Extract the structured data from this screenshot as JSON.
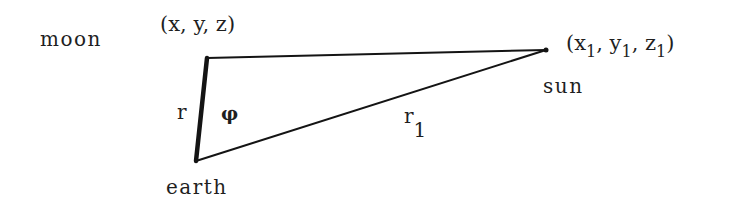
{
  "diagram": {
    "type": "triangle",
    "nodes": {
      "moon": {
        "name": "moon",
        "coords": "(x, y, z)",
        "point": [
          207,
          58
        ]
      },
      "sun": {
        "name": "sun",
        "coords_prefix": "(",
        "coords_x": "x",
        "coords_y": "y",
        "coords_z": "z",
        "coords_sub": "1",
        "coords_sep": ", ",
        "coords_suffix": ")",
        "point": [
          546,
          50
        ]
      },
      "earth": {
        "name": "earth",
        "point": [
          196,
          161
        ]
      }
    },
    "edges": {
      "earth_moon": {
        "label": "r",
        "emphasized": true
      },
      "moon_sun": {
        "label": ""
      },
      "earth_sun": {
        "label": "r",
        "label_sub": "1"
      }
    },
    "angle": {
      "symbol": "φ",
      "at": "earth-side interior between r and moon–sun"
    },
    "colors": {
      "stroke": "#141414",
      "text": "#1f1f1f",
      "background": "#ffffff"
    }
  }
}
